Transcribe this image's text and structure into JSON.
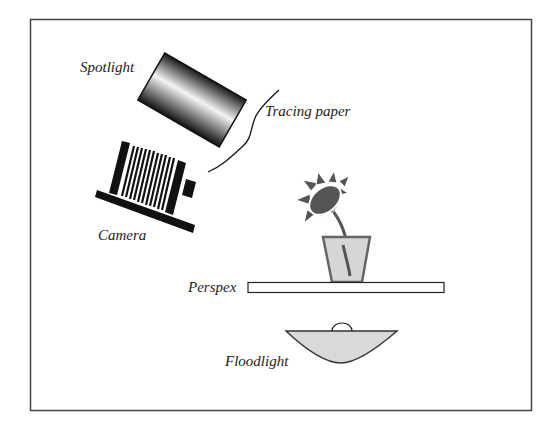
{
  "diagram": {
    "type": "photography lighting setup",
    "labels": {
      "spotlight": "Spotlight",
      "tracing_paper": "Tracing paper",
      "camera": "Camera",
      "perspex": "Perspex",
      "floodlight": "Floodlight"
    },
    "colors": {
      "frame": "#444444",
      "stroke": "#111111",
      "flower_dark": "#555555",
      "pot_fill": "#d6d6d6",
      "pot_stroke": "#666666",
      "floodlight_fill": "#d9d9d9"
    }
  }
}
